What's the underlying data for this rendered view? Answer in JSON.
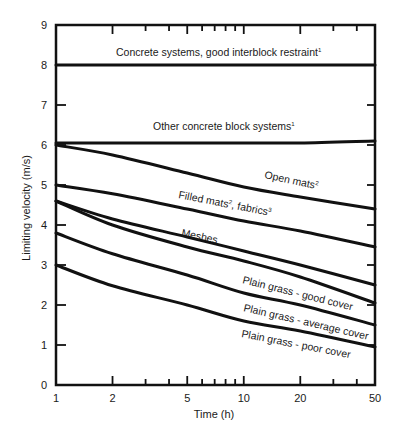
{
  "chart_data": {
    "type": "line",
    "title": "",
    "xlabel": "Time (h)",
    "ylabel": "Limiting velocity (m/s)",
    "xscale": "log",
    "xlim": [
      1,
      50
    ],
    "ylim": [
      0,
      9
    ],
    "grid": false,
    "legend": "inline labels",
    "x_ticks": [
      1,
      2,
      5,
      10,
      20,
      50
    ],
    "x_tick_labels": [
      "1",
      "2",
      "5",
      "10",
      "20",
      "50"
    ],
    "x_minor_ticks": [
      3,
      4,
      6,
      7,
      8,
      9,
      30,
      40
    ],
    "y_ticks": [
      0,
      1,
      2,
      3,
      4,
      5,
      6,
      7,
      8,
      9
    ],
    "y_tick_labels": [
      "0",
      "1",
      "2",
      "3",
      "4",
      "5",
      "6",
      "7",
      "8",
      "9"
    ],
    "x": [
      1,
      2,
      5,
      10,
      20,
      50
    ],
    "series": [
      {
        "name": "Concrete systems, good interblock restraint¹",
        "label": "Concrete systems, good interblock restraint",
        "sup": "1",
        "values": [
          8.0,
          8.0,
          8.0,
          8.0,
          8.0,
          8.0
        ]
      },
      {
        "name": "Other concrete block systems¹",
        "label": "Other concrete block systems",
        "sup": "1",
        "values": [
          6.05,
          6.05,
          6.05,
          6.05,
          6.05,
          6.1
        ]
      },
      {
        "name": "Open mats²",
        "label": "Open mats",
        "sup": "2",
        "values": [
          6.0,
          5.75,
          5.3,
          4.95,
          4.7,
          4.4
        ]
      },
      {
        "name": "Filled mats², fabrics³",
        "label": "Filled mats",
        "sup": "2",
        "label2": ", fabrics",
        "sup2": "3",
        "values": [
          5.0,
          4.78,
          4.4,
          4.1,
          3.85,
          3.45
        ]
      },
      {
        "name": "Meshes",
        "label": "Meshes",
        "values": [
          4.6,
          4.15,
          3.7,
          3.35,
          3.0,
          2.5
        ]
      },
      {
        "name": "Plain grass - good cover",
        "label": "Plain grass - good cover",
        "values": [
          4.6,
          4.0,
          3.45,
          3.1,
          2.7,
          2.05
        ]
      },
      {
        "name": "Plain grass - average cover",
        "label": "Plain grass - average cover",
        "values": [
          3.8,
          3.28,
          2.75,
          2.3,
          2.0,
          1.5
        ]
      },
      {
        "name": "Plain grass - poor cover",
        "label": "Plain grass - poor cover",
        "values": [
          3.0,
          2.48,
          2.0,
          1.6,
          1.35,
          0.95
        ]
      }
    ]
  }
}
